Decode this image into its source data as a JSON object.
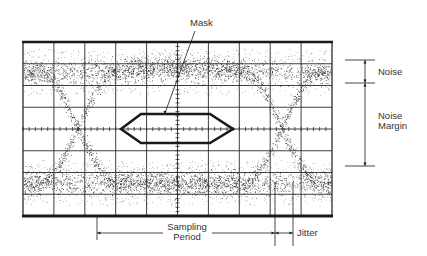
{
  "labels": {
    "mask": "Mask",
    "noise": "Noise",
    "noise_margin_line1": "Noise",
    "noise_margin_line2": "Margin",
    "sampling_period_line1": "Sampling",
    "sampling_period_line2": "Period",
    "jitter": "Jitter"
  },
  "colors": {
    "ink": "#1a1a1a",
    "grid": "#2a2a2a",
    "text": "#333333",
    "background": "#ffffff",
    "dots": "#111111"
  },
  "graticule": {
    "left": 23,
    "right": 332,
    "top": 42,
    "bottom": 216,
    "h_divisions": 10,
    "v_divisions": 8,
    "center_x": 177,
    "center_y": 129
  },
  "eye": {
    "top_rail_y": 72,
    "bottom_rail_y": 183,
    "rail_spread": 11,
    "left_crossing_x": 78,
    "right_crossing_x": 282,
    "crossing_y": 138,
    "transition_halfwidth": 40,
    "trace_spread": 7
  },
  "mask": {
    "points": [
      [
        121,
        129
      ],
      [
        141,
        114
      ],
      [
        210,
        114
      ],
      [
        233,
        129
      ],
      [
        210,
        143
      ],
      [
        141,
        143
      ]
    ]
  },
  "annotations": {
    "mask_leader": {
      "x1": 195,
      "y1": 31,
      "x2": 165,
      "y2": 113
    },
    "noise": {
      "x": 365,
      "y_top": 60,
      "y_bottom": 83,
      "tick_x1": 345,
      "tick_x2": 375
    },
    "noise_margin": {
      "x": 365,
      "y_top": 83,
      "y_bottom": 166,
      "tick_x1": 345,
      "tick_x2": 375
    },
    "sampling_period": {
      "x_left": 97,
      "x_right": 275,
      "y": 233,
      "line_top": 216,
      "line_bottom": 240
    },
    "jitter": {
      "x_left": 275,
      "x_right": 293,
      "y": 233,
      "line_top": 182,
      "line_bottom": 246
    }
  }
}
